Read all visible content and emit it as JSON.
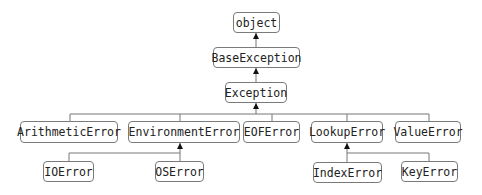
{
  "diagram": {
    "colors": {
      "border": "#7a7a7a",
      "line": "#777777",
      "text": "#222222",
      "arrow": "#111111"
    },
    "nodes": {
      "object": "object",
      "base_exception": "BaseException",
      "exception": "Exception",
      "arithmetic_error": "ArithmeticError",
      "environment_error": "EnvironmentError",
      "eof_error": "EOFError",
      "lookup_error": "LookupError",
      "value_error": "ValueError",
      "io_error": "IOError",
      "os_error": "OSError",
      "index_error": "IndexError",
      "key_error": "KeyError"
    },
    "edges": [
      {
        "from": "BaseException",
        "to": "object"
      },
      {
        "from": "Exception",
        "to": "BaseException"
      },
      {
        "from": "ArithmeticError",
        "to": "Exception"
      },
      {
        "from": "EnvironmentError",
        "to": "Exception"
      },
      {
        "from": "EOFError",
        "to": "Exception"
      },
      {
        "from": "LookupError",
        "to": "Exception"
      },
      {
        "from": "ValueError",
        "to": "Exception"
      },
      {
        "from": "IOError",
        "to": "EnvironmentError"
      },
      {
        "from": "OSError",
        "to": "EnvironmentError"
      },
      {
        "from": "IndexError",
        "to": "LookupError"
      },
      {
        "from": "KeyError",
        "to": "LookupError"
      }
    ]
  }
}
